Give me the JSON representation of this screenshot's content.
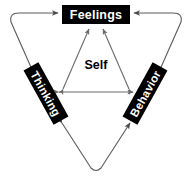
{
  "diagram": {
    "center_label": "Self",
    "nodes": [
      {
        "id": "feelings",
        "label": "Feelings",
        "rotation_deg": 0
      },
      {
        "id": "thinking",
        "label": "Thinking",
        "rotation_deg": 61
      },
      {
        "id": "behavior",
        "label": "Behavior",
        "rotation_deg": -61
      }
    ],
    "inner_connections": [
      {
        "from": "thinking",
        "to": "feelings",
        "arrows": "both"
      },
      {
        "from": "behavior",
        "to": "feelings",
        "arrows": "both"
      },
      {
        "from": "thinking",
        "to": "behavior",
        "arrows": "both"
      }
    ],
    "outer_connections": [
      {
        "from": "thinking",
        "to": "feelings",
        "arrows": "both",
        "side": "left"
      },
      {
        "from": "behavior",
        "to": "feelings",
        "arrows": "both",
        "side": "right"
      },
      {
        "from": "thinking",
        "to": "behavior",
        "arrows": "both",
        "side": "bottom"
      }
    ],
    "colors": {
      "box_fill": "#000000",
      "box_text": "#ffffff",
      "center_text": "#000000",
      "line": "#5a5a5a",
      "inner_line": "#6b6b6b",
      "background": "#ffffff"
    }
  }
}
